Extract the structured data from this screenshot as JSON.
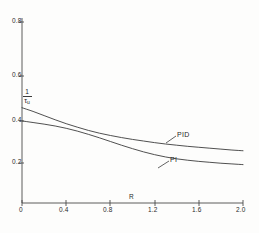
{
  "chart_data": {
    "type": "line",
    "title": "",
    "xlabel": "R",
    "ylabel_numerator": "1",
    "ylabel_denominator": "τ",
    "ylabel_denominator_sub": "u",
    "xlim": [
      0,
      2.0
    ],
    "ylim": [
      0,
      0.8
    ],
    "xticks": [
      "0",
      "0.4",
      "0.8",
      "1.2",
      "1.6",
      "2.0"
    ],
    "xtick_values": [
      0,
      0.4,
      0.8,
      1.2,
      1.6,
      2.0
    ],
    "yticks": [
      "0.2",
      "0.4",
      "0.6",
      "0.8"
    ],
    "ytick_values": [
      0.2,
      0.4,
      0.6,
      0.8
    ],
    "grid": false,
    "legend": "inline-annotations",
    "x": [
      0,
      0.1,
      0.2,
      0.3,
      0.4,
      0.5,
      0.6,
      0.7,
      0.8,
      0.9,
      1.0,
      1.1,
      1.2,
      1.3,
      1.4,
      1.5,
      1.6,
      1.7,
      1.8,
      1.9,
      2.0
    ],
    "series": [
      {
        "name": "PID",
        "values": [
          0.412,
          0.396,
          0.378,
          0.36,
          0.343,
          0.328,
          0.314,
          0.302,
          0.292,
          0.283,
          0.275,
          0.268,
          0.261,
          0.255,
          0.25,
          0.245,
          0.241,
          0.237,
          0.233,
          0.229,
          0.226
        ]
      },
      {
        "name": "PI",
        "values": [
          0.355,
          0.348,
          0.341,
          0.333,
          0.323,
          0.311,
          0.297,
          0.282,
          0.266,
          0.25,
          0.235,
          0.221,
          0.209,
          0.199,
          0.191,
          0.185,
          0.18,
          0.176,
          0.172,
          0.169,
          0.166
        ]
      }
    ],
    "annotations": [
      {
        "text": "PID",
        "x": 1.62,
        "y": 0.272
      },
      {
        "text": "PI",
        "x": 1.55,
        "y": 0.213
      }
    ]
  },
  "axis": {
    "x_title": "R",
    "origin_label": "0"
  },
  "colors": {
    "axis": "#4a4a4a",
    "curve": "#3c3c3c",
    "text": "#2b2b2b",
    "background": "#fdfdfc"
  }
}
